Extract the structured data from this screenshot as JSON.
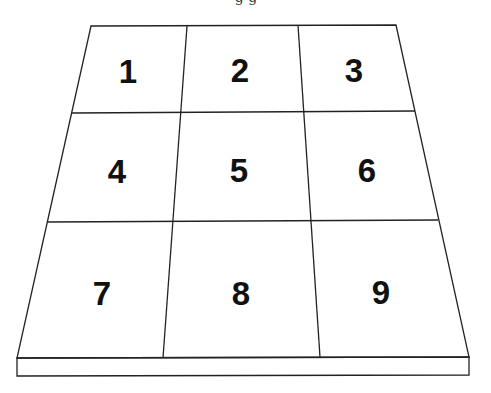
{
  "diagram": {
    "type": "perspective-grid",
    "rows": 3,
    "columns": 3,
    "caption_fragment": "g  g",
    "colors": {
      "line": "#222222",
      "label": "#111111",
      "background": "#ffffff"
    },
    "cells": [
      {
        "label": "1",
        "row": 1,
        "col": 1,
        "x": 128,
        "y": 83
      },
      {
        "label": "2",
        "row": 1,
        "col": 2,
        "x": 240,
        "y": 82
      },
      {
        "label": "3",
        "row": 1,
        "col": 3,
        "x": 354,
        "y": 82
      },
      {
        "label": "4",
        "row": 2,
        "col": 1,
        "x": 117,
        "y": 183
      },
      {
        "label": "5",
        "row": 2,
        "col": 2,
        "x": 239,
        "y": 182
      },
      {
        "label": "6",
        "row": 2,
        "col": 3,
        "x": 367,
        "y": 182
      },
      {
        "label": "7",
        "row": 3,
        "col": 1,
        "x": 102,
        "y": 305
      },
      {
        "label": "8",
        "row": 3,
        "col": 2,
        "x": 241,
        "y": 305
      },
      {
        "label": "9",
        "row": 3,
        "col": 3,
        "x": 381,
        "y": 304
      }
    ]
  }
}
